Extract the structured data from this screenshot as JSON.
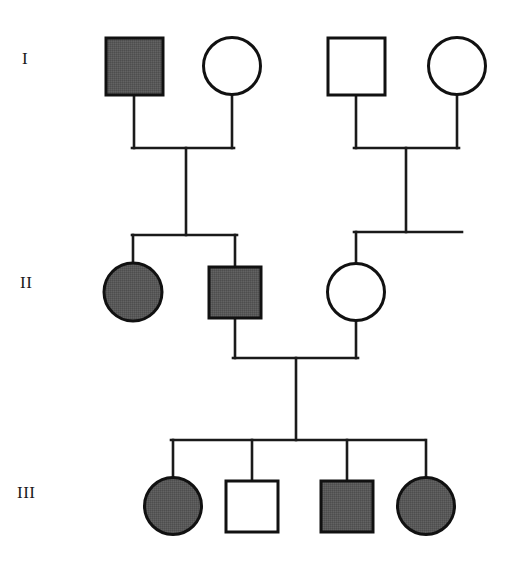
{
  "figure": {
    "kind": "pedigree-chart",
    "width": 506,
    "height": 564,
    "background_color": "#ffffff",
    "line_color": "#1a1a1a",
    "affected_fill_color": "#585858",
    "unaffected_fill_color": "#ffffff",
    "symbol_stroke_color": "#111111"
  },
  "generation_labels": [
    {
      "id": "gen-1",
      "text": "I",
      "x": 22,
      "y": 58
    },
    {
      "id": "gen-2",
      "text": "II",
      "x": 20,
      "y": 282
    },
    {
      "id": "gen-3",
      "text": "III",
      "x": 17,
      "y": 492
    }
  ],
  "legend_meaning": {
    "square": "male",
    "circle": "female",
    "filled": "affected",
    "open": "unaffected"
  },
  "individuals": [
    {
      "id": "I-1",
      "generation": "I",
      "sex": "male",
      "shape": "square",
      "status": "affected",
      "filled": true,
      "cx": 134,
      "cy": 66,
      "size": 57
    },
    {
      "id": "I-2",
      "generation": "I",
      "sex": "female",
      "shape": "circle",
      "status": "unaffected",
      "filled": false,
      "cx": 232,
      "cy": 66,
      "size": 57
    },
    {
      "id": "I-3",
      "generation": "I",
      "sex": "male",
      "shape": "square",
      "status": "unaffected",
      "filled": false,
      "cx": 356,
      "cy": 66,
      "size": 57
    },
    {
      "id": "I-4",
      "generation": "I",
      "sex": "female",
      "shape": "circle",
      "status": "unaffected",
      "filled": false,
      "cx": 457,
      "cy": 66,
      "size": 57
    },
    {
      "id": "II-1",
      "generation": "II",
      "sex": "female",
      "shape": "circle",
      "status": "affected",
      "filled": true,
      "cx": 133,
      "cy": 291,
      "size": 58
    },
    {
      "id": "II-2",
      "generation": "II",
      "sex": "male",
      "shape": "square",
      "status": "affected",
      "filled": true,
      "cx": 235,
      "cy": 292,
      "size": 52
    },
    {
      "id": "II-3",
      "generation": "II",
      "sex": "female",
      "shape": "circle",
      "status": "unaffected",
      "filled": false,
      "cx": 356,
      "cy": 292,
      "size": 57
    },
    {
      "id": "III-1",
      "generation": "III",
      "sex": "female",
      "shape": "circle",
      "status": "affected",
      "filled": true,
      "cx": 173,
      "cy": 506,
      "size": 57
    },
    {
      "id": "III-2",
      "generation": "III",
      "sex": "male",
      "shape": "square",
      "status": "unaffected",
      "filled": false,
      "cx": 252,
      "cy": 506,
      "size": 52
    },
    {
      "id": "III-3",
      "generation": "III",
      "sex": "male",
      "shape": "square",
      "status": "affected",
      "filled": true,
      "cx": 347,
      "cy": 506,
      "size": 52
    },
    {
      "id": "III-4",
      "generation": "III",
      "sex": "female",
      "shape": "circle",
      "status": "affected",
      "filled": true,
      "cx": 426,
      "cy": 506,
      "size": 57
    }
  ],
  "matings": [
    {
      "id": "mating-I-1-x-I-2",
      "partners": [
        "I-1",
        "I-2"
      ],
      "drop_from_partners_y": 148,
      "left_x": 134,
      "right_x": 232,
      "partner_bottom_y": 95,
      "descent_x": 186,
      "sibship_bar_y": 235,
      "children": [
        "II-1",
        "II-2"
      ],
      "child_drop_xs": [
        133,
        235
      ]
    },
    {
      "id": "mating-I-3-x-I-4",
      "partners": [
        "I-3",
        "I-4"
      ],
      "drop_from_partners_y": 148,
      "left_x": 356,
      "right_x": 457,
      "partner_bottom_y": 95,
      "descent_x": 406,
      "sibship_bar_y": 232,
      "sibship_bar_x1": 355,
      "sibship_bar_x2": 462,
      "children": [
        "II-3"
      ],
      "child_drop_xs": [
        356
      ]
    },
    {
      "id": "mating-II-2-x-II-3",
      "partners": [
        "II-2",
        "II-3"
      ],
      "drop_from_partners_y": 358,
      "left_x": 235,
      "right_x": 356,
      "partner_bottom_y": 318,
      "descent_x": 296,
      "sibship_bar_y": 440,
      "children": [
        "III-1",
        "III-2",
        "III-3",
        "III-4"
      ],
      "child_drop_xs": [
        173,
        252,
        347,
        426
      ]
    }
  ]
}
